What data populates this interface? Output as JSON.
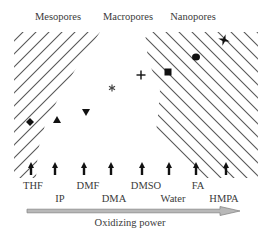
{
  "regions": [
    {
      "label": "Mesopores",
      "x": 58
    },
    {
      "label": "Macropores",
      "x": 128
    },
    {
      "label": "Nanopores",
      "x": 193
    }
  ],
  "solvents": [
    {
      "label": "THF",
      "arrow_x": 31,
      "label_x": 33,
      "row": 0
    },
    {
      "label": "IP",
      "arrow_x": 55,
      "label_x": 60,
      "row": 1
    },
    {
      "label": "DMF",
      "arrow_x": 84,
      "label_x": 88,
      "row": 0
    },
    {
      "label": "DMA",
      "arrow_x": 111,
      "label_x": 114,
      "row": 1
    },
    {
      "label": "DMSO",
      "arrow_x": 142,
      "label_x": 146,
      "row": 0
    },
    {
      "label": "Water",
      "arrow_x": 169,
      "label_x": 173,
      "row": 1
    },
    {
      "label": "FA",
      "arrow_x": 196,
      "label_x": 198,
      "row": 0
    },
    {
      "label": "HMPA",
      "arrow_x": 226,
      "label_x": 224,
      "row": 1
    }
  ],
  "markers": [
    {
      "shape": "diamond",
      "x": 30,
      "y": 122
    },
    {
      "shape": "triangle-up",
      "x": 57,
      "y": 120
    },
    {
      "shape": "triangle-down",
      "x": 86,
      "y": 112
    },
    {
      "shape": "asterisk",
      "x": 112,
      "y": 88
    },
    {
      "shape": "plus",
      "x": 141,
      "y": 75
    },
    {
      "shape": "square",
      "x": 168,
      "y": 72
    },
    {
      "shape": "circle",
      "x": 196,
      "y": 57
    },
    {
      "shape": "star",
      "x": 224,
      "y": 40
    }
  ],
  "axis": {
    "title": "Oxidizing power",
    "title_x": 130,
    "arrow_start_x": 27,
    "arrow_end_x": 240,
    "arrow_y": 211,
    "fill_color": "#b8b8b8",
    "stroke_color": "#888888"
  },
  "colors": {
    "hatch": "#555555",
    "marker": "#111111",
    "text": "#3a3a3a"
  }
}
